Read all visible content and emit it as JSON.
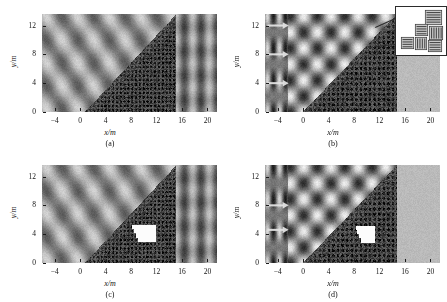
{
  "figure": {
    "background_color": "#ffffff",
    "panel_count": 4,
    "axis_color": "#1a1a1a"
  },
  "axes": {
    "xlabel": "x/m",
    "ylabel": "y/m",
    "xticks": [
      "−4",
      "0",
      "4",
      "8",
      "12",
      "16",
      "20"
    ],
    "xtick_values": [
      -4,
      0,
      4,
      8,
      12,
      16,
      20
    ],
    "yticks": [
      "0",
      "4",
      "8",
      "12"
    ],
    "ytick_values": [
      0,
      4,
      8,
      12
    ],
    "xlim": [
      -6,
      21.5
    ],
    "ylim": [
      0,
      13.6
    ]
  },
  "panels": [
    {
      "id": "a",
      "caption": "(a)",
      "field_type": "oblique-plane-wave",
      "wave_angle_deg": 38,
      "wavelength_m": 3.9,
      "crystal": {
        "shape": "triangle",
        "x_start": 0.6,
        "x_end": 15.0,
        "lattice": "square-tilted",
        "defect": null
      },
      "transmitted_region": {
        "x_from": 15.0,
        "x_to": 21.5,
        "pattern": "vertical-bands"
      },
      "arrows": []
    },
    {
      "id": "b",
      "caption": "(b)",
      "field_type": "standing-lattice-cells",
      "wave_angle_deg": 0,
      "wavelength_m": 4.3,
      "crystal": {
        "shape": "triangle",
        "x_start": -0.2,
        "x_end": 14.6,
        "lattice": "diagonal-scatter",
        "defect": null
      },
      "transmitted_region": {
        "x_from": 14.6,
        "x_to": 21.5,
        "pattern": "uniform-gray"
      },
      "arrows": [
        {
          "y_m": 12.0,
          "direction": "right"
        },
        {
          "y_m": 8.0,
          "direction": "right"
        },
        {
          "y_m": 4.0,
          "direction": "right"
        }
      ],
      "inset": {
        "present": true,
        "content": "magnified-rod-blocks",
        "block_count": 6,
        "description": "square blocks composed of parallel rods"
      }
    },
    {
      "id": "c",
      "caption": "(c)",
      "field_type": "oblique-plane-wave",
      "wave_angle_deg": 38,
      "wavelength_m": 3.9,
      "crystal": {
        "shape": "triangle",
        "x_start": 0.6,
        "x_end": 15.0,
        "lattice": "square-tilted",
        "defect": {
          "shape": "stepped-notch",
          "x_from": 8.0,
          "x_to": 11.8,
          "y_from": 3.0,
          "y_to": 5.4,
          "color": "#ffffff"
        }
      },
      "transmitted_region": {
        "x_from": 15.0,
        "x_to": 21.5,
        "pattern": "vertical-bands"
      },
      "arrows": []
    },
    {
      "id": "d",
      "caption": "(d)",
      "field_type": "standing-lattice-cells",
      "wave_angle_deg": 0,
      "wavelength_m": 4.3,
      "crystal": {
        "shape": "triangle",
        "x_start": -0.2,
        "x_end": 14.6,
        "lattice": "diagonal-scatter",
        "defect": {
          "shape": "stepped-notch",
          "x_from": 8.2,
          "x_to": 11.2,
          "y_from": 2.9,
          "y_to": 5.2,
          "color": "#ffffff"
        }
      },
      "transmitted_region": {
        "x_from": 14.6,
        "x_to": 21.5,
        "pattern": "uniform-gray"
      },
      "arrows": [
        {
          "y_m": 8.0,
          "direction": "right"
        },
        {
          "y_m": 4.6,
          "direction": "right"
        }
      ]
    }
  ]
}
